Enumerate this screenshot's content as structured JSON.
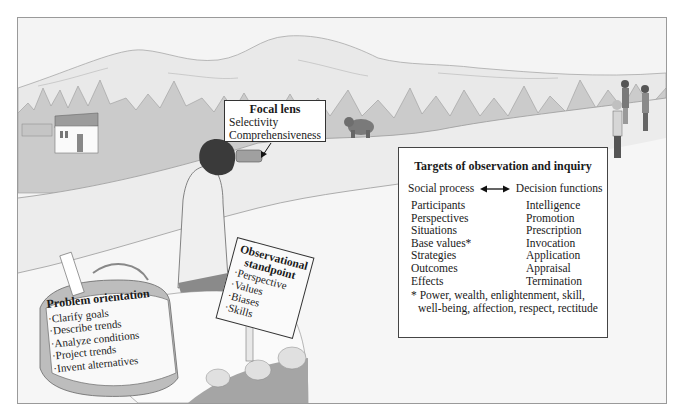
{
  "figure": {
    "colors": {
      "background": "#f3f3f3",
      "frame_border": "#9a9a9a",
      "trees": "#c9c9c9",
      "mountains": "#e8e8e8",
      "box_fill": "#ffffff",
      "text": "#1a1a1a"
    }
  },
  "focal_lens": {
    "title": "Focal lens",
    "items": [
      "Selectivity",
      "Comprehensiveness"
    ]
  },
  "targets": {
    "title": "Targets of observation and inquiry",
    "left_heading": "Social process",
    "right_heading": "Decision functions",
    "arrow_icon": "double-headed-arrow",
    "social_process": [
      "Participants",
      "Perspectives",
      "Situations",
      "Base values*",
      "Strategies",
      "Outcomes",
      "Effects"
    ],
    "decision_functions": [
      "Intelligence",
      "Promotion",
      "Prescription",
      "Invocation",
      "Application",
      "Appraisal",
      "Termination"
    ],
    "footnote_line1": "* Power, wealth, enlightenment, skill,",
    "footnote_line2": "well-being, affection, respect, rectitude"
  },
  "observational_standpoint": {
    "title_line1": "Observational",
    "title_line2": "standpoint",
    "items": [
      "·Perspective",
      "·Values",
      "·Biases",
      "·Skills"
    ]
  },
  "problem_orientation": {
    "title": "Problem orientation",
    "items": [
      "·Clarify goals",
      "·Describe trends",
      "·Analyze conditions",
      "·Project trends",
      "·Invent alternatives"
    ]
  }
}
